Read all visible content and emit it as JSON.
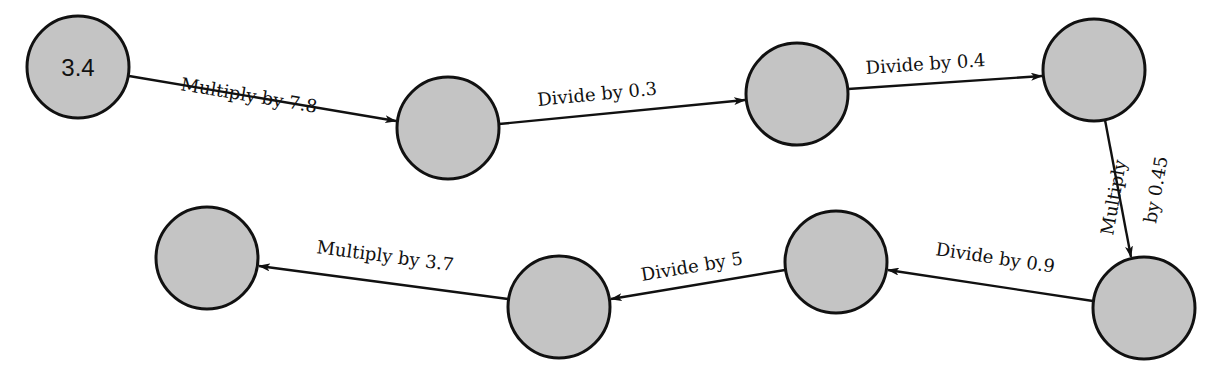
{
  "diagram": {
    "type": "flow-chain",
    "colors": {
      "node_fill": "#c4c4c4",
      "node_stroke": "#111111",
      "edge": "#111111",
      "background": "#ffffff"
    },
    "nodes": [
      {
        "id": "n1",
        "label": "3.4",
        "cx": 78,
        "cy": 67,
        "r": 51
      },
      {
        "id": "n2",
        "label": "",
        "cx": 448,
        "cy": 128,
        "r": 51
      },
      {
        "id": "n3",
        "label": "",
        "cx": 797,
        "cy": 94,
        "r": 51
      },
      {
        "id": "n4",
        "label": "",
        "cx": 1094,
        "cy": 70,
        "r": 51
      },
      {
        "id": "n5",
        "label": "",
        "cx": 1144,
        "cy": 308,
        "r": 51
      },
      {
        "id": "n6",
        "label": "",
        "cx": 836,
        "cy": 262,
        "r": 51
      },
      {
        "id": "n7",
        "label": "",
        "cx": 559,
        "cy": 307,
        "r": 51
      },
      {
        "id": "n8",
        "label": "",
        "cx": 207,
        "cy": 258,
        "r": 51
      }
    ],
    "edges": [
      {
        "from": "n1",
        "to": "n2",
        "label": "Multiply by 7.8"
      },
      {
        "from": "n2",
        "to": "n3",
        "label": "Divide by 0.3"
      },
      {
        "from": "n3",
        "to": "n4",
        "label": "Divide by 0.4"
      },
      {
        "from": "n4",
        "to": "n5",
        "label_line1": "Multiply",
        "label_line2": "by 0.45"
      },
      {
        "from": "n5",
        "to": "n6",
        "label": "Divide by 0.9"
      },
      {
        "from": "n6",
        "to": "n7",
        "label": "Divide by 5"
      },
      {
        "from": "n7",
        "to": "n8",
        "label": "Multiply by 3.7"
      }
    ]
  }
}
